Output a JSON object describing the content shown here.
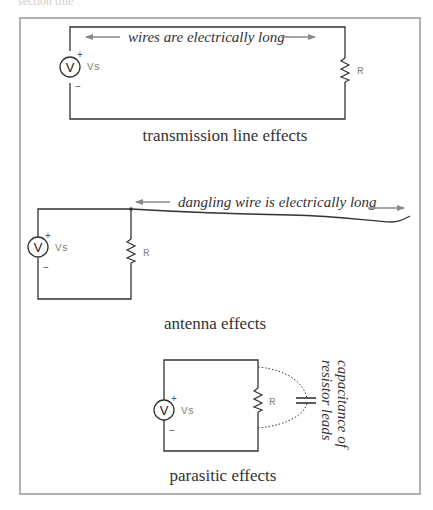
{
  "header_fragment": "section title",
  "panels": [
    {
      "id": "transmission",
      "caption": "transmission line effects",
      "annotation": "wires are electrically long",
      "source": {
        "symbol": "V",
        "label": "Vs",
        "plus": "+",
        "minus": "−"
      },
      "load": {
        "label": "R"
      }
    },
    {
      "id": "antenna",
      "caption": "antenna effects",
      "annotation": "dangling wire is electrically long",
      "source": {
        "symbol": "V",
        "label": "Vs",
        "plus": "+",
        "minus": "−"
      },
      "load": {
        "label": "R"
      }
    },
    {
      "id": "parasitic",
      "caption": "parasitic effects",
      "annotation_line1": "capacitance of",
      "annotation_line2": "resistor leads",
      "source": {
        "symbol": "V",
        "label": "Vs",
        "plus": "+",
        "minus": "−"
      },
      "load": {
        "label": "R"
      }
    }
  ],
  "colors": {
    "wire": "#333333",
    "arrow": "#888888",
    "frame": "#999999",
    "text": "#333333"
  }
}
